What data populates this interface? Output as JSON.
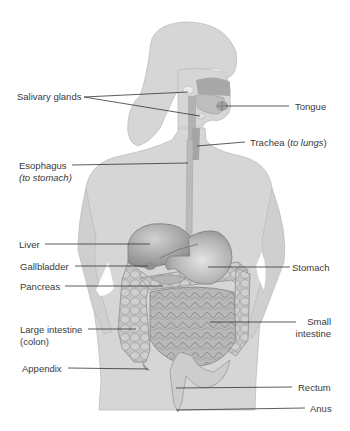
{
  "diagram": {
    "colors": {
      "silhouette": "#d6d6d6",
      "silhouette_edge": "#b9b9b9",
      "organ_dark": "#9a9a9a",
      "organ_mid": "#b0b0b0",
      "leader_line": "#333333",
      "label_text": "#3a3a3a"
    },
    "labels_left": [
      {
        "id": "salivary-glands",
        "text": "Salivary glands"
      },
      {
        "id": "esophagus",
        "text": "Esophagus",
        "sub": "(to stomach)"
      },
      {
        "id": "liver",
        "text": "Liver"
      },
      {
        "id": "gallbladder",
        "text": "Gallbladder"
      },
      {
        "id": "pancreas",
        "text": "Pancreas"
      },
      {
        "id": "large-intestine",
        "text": "Large intestine",
        "sub": "(colon)"
      },
      {
        "id": "appendix",
        "text": "Appendix"
      }
    ],
    "labels_right": [
      {
        "id": "tongue",
        "text": "Tongue"
      },
      {
        "id": "trachea",
        "text": "Trachea (",
        "italic": "to lungs",
        "after": ")"
      },
      {
        "id": "stomach",
        "text": "Stomach"
      },
      {
        "id": "small-intestine",
        "text": "Small",
        "sub": "intestine"
      },
      {
        "id": "rectum",
        "text": "Rectum"
      },
      {
        "id": "anus",
        "text": "Anus"
      }
    ]
  }
}
